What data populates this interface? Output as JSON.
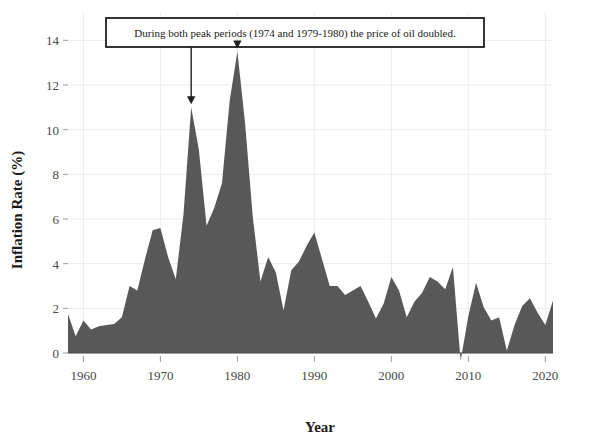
{
  "chart_data": {
    "type": "area",
    "title": "",
    "xlabel": "Year",
    "ylabel": "Inflation Rate (%)",
    "xlim": [
      1958,
      2021
    ],
    "ylim": [
      -0.4,
      15.0
    ],
    "xticks": [
      1960,
      1970,
      1980,
      1990,
      2000,
      2010,
      2020
    ],
    "xticklabels": [
      "1960",
      "1970",
      "1980",
      "1990",
      "2000",
      "2010",
      "2020"
    ],
    "yticks": [
      0,
      2,
      4,
      6,
      8,
      10,
      12,
      14
    ],
    "yticklabels": [
      "0",
      "2",
      "4",
      "6",
      "8",
      "10",
      "12",
      "14"
    ],
    "grid": true,
    "legend": false,
    "fill_color": "#585858",
    "annotations": [
      {
        "text": "During both peak periods (1974 and 1979-1980) the price of oil doubled.",
        "arrow_targets": [
          {
            "x": 1974,
            "y": 11.0
          },
          {
            "x": 1980,
            "y": 13.5
          }
        ]
      }
    ],
    "series": [
      {
        "name": "Inflation Rate",
        "x": [
          1958,
          1959,
          1960,
          1961,
          1962,
          1963,
          1964,
          1965,
          1966,
          1967,
          1968,
          1969,
          1970,
          1971,
          1972,
          1973,
          1974,
          1975,
          1976,
          1977,
          1978,
          1979,
          1980,
          1981,
          1982,
          1983,
          1984,
          1985,
          1986,
          1987,
          1988,
          1989,
          1990,
          1991,
          1992,
          1993,
          1994,
          1995,
          1996,
          1997,
          1998,
          1999,
          2000,
          2001,
          2002,
          2003,
          2004,
          2005,
          2006,
          2007,
          2008,
          2009,
          2010,
          2011,
          2012,
          2013,
          2014,
          2015,
          2016,
          2017,
          2018,
          2019,
          2020,
          2021
        ],
        "values": [
          1.75,
          0.75,
          1.45,
          1.05,
          1.2,
          1.25,
          1.3,
          1.6,
          3.0,
          2.8,
          4.2,
          5.5,
          5.6,
          4.3,
          3.3,
          6.2,
          11.0,
          9.1,
          5.7,
          6.5,
          7.6,
          11.3,
          13.5,
          10.3,
          6.1,
          3.2,
          4.3,
          3.6,
          1.9,
          3.7,
          4.1,
          4.8,
          5.4,
          4.2,
          3.0,
          3.0,
          2.6,
          2.8,
          3.0,
          2.3,
          1.55,
          2.2,
          3.4,
          2.8,
          1.6,
          2.3,
          2.7,
          3.4,
          3.2,
          2.85,
          3.85,
          -0.35,
          1.65,
          3.15,
          2.05,
          1.45,
          1.6,
          0.1,
          1.25,
          2.1,
          2.45,
          1.8,
          1.25,
          2.35
        ]
      }
    ]
  }
}
